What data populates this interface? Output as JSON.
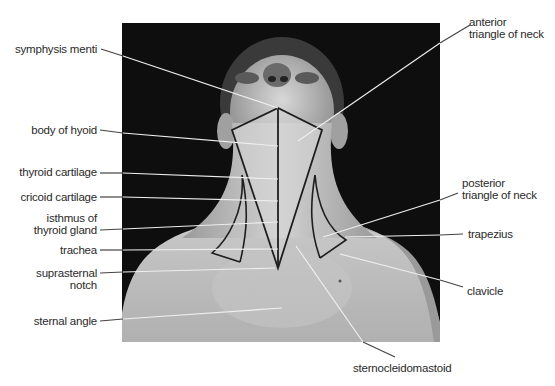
{
  "figure": {
    "colors": {
      "background": "#ffffff",
      "photo_background": "#0e0e0e",
      "skin_light": "#d4d4d4",
      "skin_mid": "#b8b8b8",
      "outline": "#1e1e1e",
      "leader_line": "#e8e8e8",
      "leader_line_outside": "#555555",
      "label_text": "#2a2a2a"
    }
  },
  "labels_left": [
    {
      "id": "symphysis-menti",
      "lines": [
        "symphysis menti"
      ]
    },
    {
      "id": "body-of-hyoid",
      "lines": [
        "body of hyoid"
      ]
    },
    {
      "id": "thyroid-cartilage",
      "lines": [
        "thyroid cartilage"
      ]
    },
    {
      "id": "cricoid-cartilage",
      "lines": [
        "cricoid cartilage"
      ]
    },
    {
      "id": "isthmus-of-thyroid-gland",
      "lines": [
        "isthmus of",
        "thyroid gland"
      ]
    },
    {
      "id": "trachea",
      "lines": [
        "trachea"
      ]
    },
    {
      "id": "suprasternal-notch",
      "lines": [
        "suprasternal",
        "notch"
      ]
    },
    {
      "id": "sternal-angle",
      "lines": [
        "sternal angle"
      ]
    }
  ],
  "labels_right": [
    {
      "id": "anterior-triangle-of-neck",
      "lines": [
        "anterior",
        "triangle of neck"
      ]
    },
    {
      "id": "posterior-triangle-of-neck",
      "lines": [
        "posterior",
        "triangle of neck"
      ]
    },
    {
      "id": "trapezius",
      "lines": [
        "trapezius"
      ]
    },
    {
      "id": "clavicle",
      "lines": [
        "clavicle"
      ]
    }
  ],
  "labels_bottom": [
    {
      "id": "sternocleidomastoid",
      "lines": [
        "sternocleidomastoid"
      ]
    }
  ]
}
